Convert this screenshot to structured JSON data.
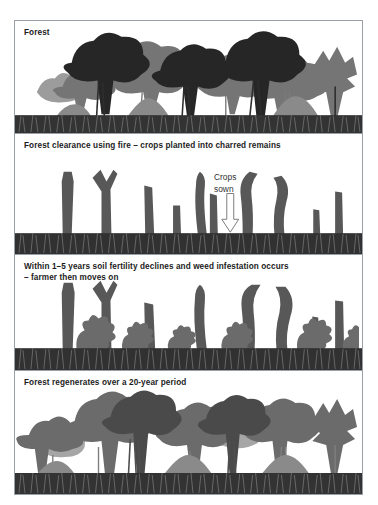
{
  "figure": {
    "frame_color": "#9aa0a6",
    "background": "#ffffff"
  },
  "palette": {
    "tree_dark": "#2b2b2b",
    "tree_mid": "#6f6f6f",
    "tree_light": "#8f8f8f",
    "stump": "#5a5a5a",
    "ground_dark": "#2f2f2f",
    "ground_grass": "#3a3a3a",
    "text": "#1c1c1c",
    "annotation_text": "#333333",
    "arrow_outline": "#777777"
  },
  "panels": [
    {
      "id": "forest",
      "caption": "Forest",
      "stage": 1,
      "description": "Mature rainforest with tall dark canopy trees and dense undergrowth"
    },
    {
      "id": "clearance",
      "caption": "Forest clearance using fire – crops planted into charred remains",
      "stage": 2,
      "description": "Burnt tree stumps remain standing in a cleared plot",
      "annotation": {
        "label": "Crops\nsown",
        "arrow": "down-arrow-icon"
      }
    },
    {
      "id": "decline",
      "caption": "Within 1–5 years soil fertility declines and weed infestation occurs\n– farmer then moves on",
      "stage": 3,
      "description": "Stumps with weeds and shrubs invading the plot"
    },
    {
      "id": "regeneration",
      "caption": "Forest regenerates over a 20-year period",
      "stage": 4,
      "description": "Secondary forest of younger grey trees has regrown"
    }
  ]
}
